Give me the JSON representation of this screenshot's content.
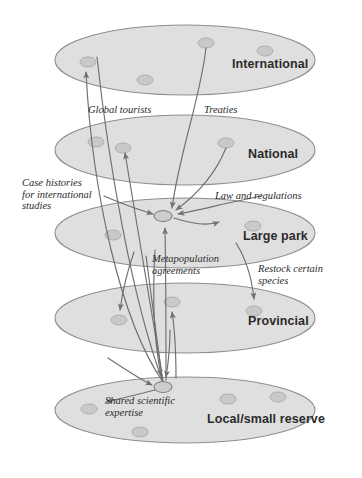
{
  "figure": {
    "type": "hierarchical-network-diagram",
    "background_color": "#ffffff",
    "plane_fill_color": "#dcdcdc",
    "plane_stroke_color": "#8e8e8e",
    "node_fill_color": "#c9c9c9",
    "arrow_color": "#6f6f6f",
    "label_color": "#2b2b2b"
  },
  "levels": [
    {
      "id": "international",
      "label": "International",
      "label_x": 232,
      "label_y": 68,
      "cx": 185,
      "cy": 60,
      "rx": 130,
      "ry": 35,
      "nodes": [
        {
          "x": 88,
          "y": 62,
          "rx": 8,
          "ry": 5
        },
        {
          "x": 145,
          "y": 80,
          "rx": 8,
          "ry": 5
        },
        {
          "x": 206,
          "y": 43,
          "rx": 8,
          "ry": 5
        },
        {
          "x": 265,
          "y": 51,
          "rx": 8,
          "ry": 5
        }
      ]
    },
    {
      "id": "national",
      "label": "National",
      "label_x": 248,
      "label_y": 158,
      "cx": 185,
      "cy": 150,
      "rx": 130,
      "ry": 35,
      "nodes": [
        {
          "x": 96,
          "y": 142,
          "rx": 8,
          "ry": 5
        },
        {
          "x": 123,
          "y": 148,
          "rx": 8,
          "ry": 5
        },
        {
          "x": 226,
          "y": 143,
          "rx": 8,
          "ry": 5
        }
      ]
    },
    {
      "id": "large-park",
      "label": "Large park",
      "label_x": 243,
      "label_y": 240,
      "cx": 185,
      "cy": 233,
      "rx": 130,
      "ry": 35,
      "nodes": [
        {
          "x": 113,
          "y": 235,
          "rx": 8,
          "ry": 5
        },
        {
          "x": 253,
          "y": 226,
          "rx": 8,
          "ry": 5
        }
      ],
      "hub": {
        "x": 163,
        "y": 216,
        "rx": 9,
        "ry": 5.5
      }
    },
    {
      "id": "provincial",
      "label": "Provincial",
      "label_x": 248,
      "label_y": 325,
      "cx": 185,
      "cy": 318,
      "rx": 130,
      "ry": 35,
      "nodes": [
        {
          "x": 119,
          "y": 320,
          "rx": 8,
          "ry": 5
        },
        {
          "x": 172,
          "y": 302,
          "rx": 8,
          "ry": 5
        },
        {
          "x": 254,
          "y": 311,
          "rx": 8,
          "ry": 5
        }
      ]
    },
    {
      "id": "local-small-reserve",
      "label": "Local/small reserve",
      "label_x": 207,
      "label_y": 423,
      "cx": 185,
      "cy": 410,
      "rx": 130,
      "ry": 33,
      "nodes": [
        {
          "x": 89,
          "y": 409,
          "rx": 8,
          "ry": 5
        },
        {
          "x": 140,
          "y": 432,
          "rx": 8,
          "ry": 5
        },
        {
          "x": 228,
          "y": 399,
          "rx": 8,
          "ry": 5
        },
        {
          "x": 278,
          "y": 397,
          "rx": 8,
          "ry": 5
        }
      ],
      "hub": {
        "x": 163,
        "y": 387,
        "rx": 9,
        "ry": 5.5
      }
    }
  ],
  "flow_labels": [
    {
      "id": "global-tourists",
      "text": "Global tourists",
      "x": 88,
      "y": 113,
      "lines": [
        "Global tourists"
      ]
    },
    {
      "id": "treaties",
      "text": "Treaties",
      "x": 204,
      "y": 113,
      "lines": [
        "Treaties"
      ]
    },
    {
      "id": "case-histories",
      "text": "Case histories for international studies",
      "x": 22,
      "y": 186,
      "lines": [
        "Case histories",
        "for international",
        "studies"
      ]
    },
    {
      "id": "law-and-regulations",
      "text": "Law and regulations",
      "x": 215,
      "y": 199,
      "lines": [
        "Law and regulations"
      ]
    },
    {
      "id": "metapopulation-agreements",
      "text": "Metapopulation agreements",
      "x": 152,
      "y": 262,
      "lines": [
        "Metapopulation",
        "agreements"
      ]
    },
    {
      "id": "restock-certain-species",
      "text": "Restock certain species",
      "x": 258,
      "y": 272,
      "lines": [
        "Restock certain",
        "species"
      ]
    },
    {
      "id": "shared-scientific-expertise",
      "text": "Shared scientific expertise",
      "x": 105,
      "y": 404,
      "lines": [
        "Shared scientific",
        "expertise"
      ]
    }
  ]
}
